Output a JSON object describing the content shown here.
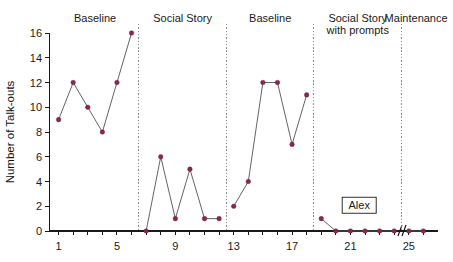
{
  "chart_data": {
    "type": "line",
    "title": "",
    "xlabel": "",
    "ylabel": "Number of Talk-outs",
    "xlim": [
      0,
      27
    ],
    "ylim": [
      0,
      16
    ],
    "grid": false,
    "legend": "none",
    "y_ticks": [
      0,
      2,
      4,
      6,
      8,
      10,
      12,
      14,
      16
    ],
    "y_tick_labels": [
      "0",
      "2",
      "4",
      "6",
      "8",
      "10",
      "12",
      "14",
      "16"
    ],
    "x_ticks": [
      1,
      2,
      3,
      4,
      5,
      6,
      7,
      8,
      9,
      10,
      11,
      12,
      13,
      14,
      15,
      16,
      17,
      18,
      19,
      20,
      21,
      22,
      23,
      24,
      25,
      26
    ],
    "x_tick_labels": [
      {
        "x": 1,
        "label": "1"
      },
      {
        "x": 5,
        "label": "5"
      },
      {
        "x": 9,
        "label": "9"
      },
      {
        "x": 13,
        "label": "13"
      },
      {
        "x": 17,
        "label": "17"
      },
      {
        "x": 21,
        "label": "21"
      },
      {
        "x": 25,
        "label": "25"
      }
    ],
    "axis_break": {
      "present": true,
      "between_x": [
        24,
        25
      ],
      "symbol": "//"
    },
    "annotations": [
      {
        "name": "subject-label",
        "text": "Alex",
        "x": 21.6,
        "y": 2.0,
        "boxed": true
      }
    ],
    "phases": [
      {
        "name": "baseline-1",
        "label": "Baseline",
        "label_line2": "",
        "x_range": [
          1,
          6
        ],
        "x": [
          1,
          2,
          3,
          4,
          5,
          6
        ],
        "values": [
          9,
          12,
          10,
          8,
          12,
          16
        ]
      },
      {
        "name": "social-story",
        "label": "Social Story",
        "label_line2": "",
        "x_range": [
          7,
          12
        ],
        "x": [
          7,
          8,
          9,
          10,
          11,
          12
        ],
        "values": [
          0,
          6,
          1,
          5,
          1,
          1
        ]
      },
      {
        "name": "baseline-2",
        "label": "Baseline",
        "label_line2": "",
        "x_range": [
          13,
          18
        ],
        "x": [
          13,
          14,
          15,
          16,
          17,
          18
        ],
        "values": [
          2,
          4,
          12,
          12,
          7,
          11
        ]
      },
      {
        "name": "social-story-with-prompts",
        "label": "Social Story",
        "label_line2": "with prompts",
        "x_range": [
          19,
          24
        ],
        "x": [
          19,
          20,
          21,
          22,
          23,
          24
        ],
        "values": [
          1,
          0,
          0,
          0,
          0,
          0
        ]
      },
      {
        "name": "maintenance",
        "label": "Maintenance",
        "label_line2": "",
        "x_range": [
          25,
          26
        ],
        "x": [
          25,
          26
        ],
        "values": [
          0,
          0
        ]
      }
    ],
    "phase_dividers_after_x": [
      6,
      12,
      18,
      24
    ],
    "colors": {
      "marker": "#8b2942",
      "line": "#5c5c5c",
      "axis": "#1a1a1a",
      "divider": "#8a8a8a",
      "background": "#ffffff"
    }
  }
}
